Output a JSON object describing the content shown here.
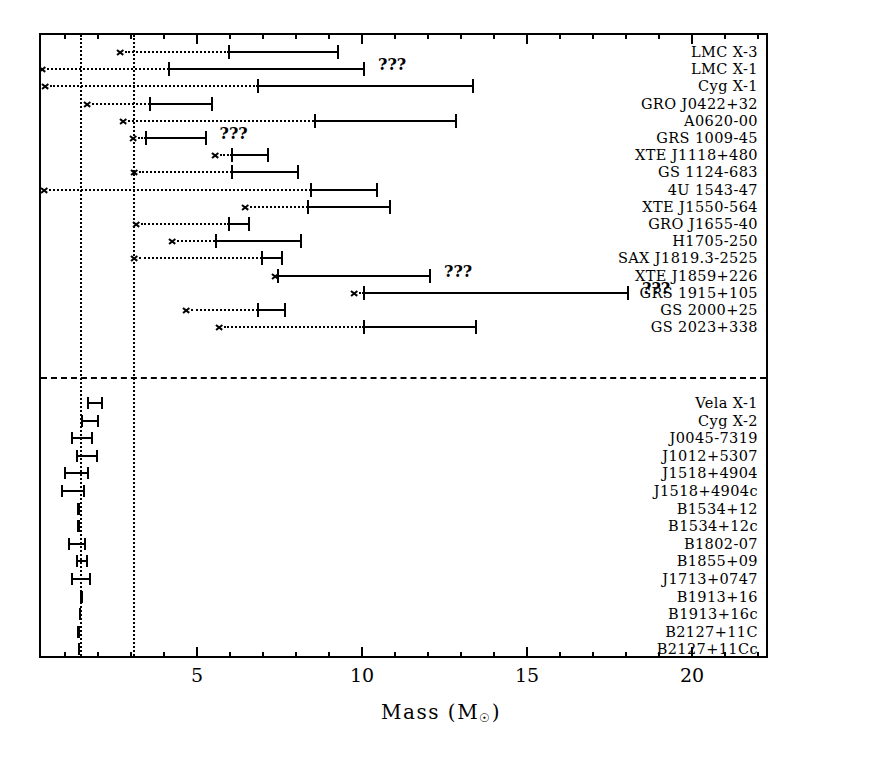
{
  "chart_data": {
    "type": "bar",
    "title": "",
    "xlabel": "Mass (M☉)",
    "ylabel": "",
    "xlim": [
      0,
      23.1
    ],
    "xticks_major": [
      5,
      10,
      15,
      20
    ],
    "xtick_labels": [
      "5",
      "10",
      "15",
      "20"
    ],
    "xticks_minor_step": 1,
    "grid": false,
    "legend": "none",
    "reference_lines": [
      {
        "name": "neutron-star-canonical-mass",
        "x": 1.4,
        "style": "dotted"
      },
      {
        "name": "maximum-neutron-star-mass",
        "x": 3.0,
        "style": "dotted"
      }
    ],
    "group_divider": {
      "style": "dashed",
      "after_row_index": 16
    },
    "groups": [
      {
        "name": "black-hole-candidates",
        "note": "upper panel, rows with dotted lower-limit arrows"
      },
      {
        "name": "neutron-stars",
        "note": "lower panel, compact error bars near 1.0-2.0 solar masses"
      }
    ],
    "rows": [
      {
        "label": "LMC X-3",
        "group": "black-hole-candidates",
        "low": 5.9,
        "high": 9.2,
        "limit_arrow_x": 2.5,
        "uncertain": false
      },
      {
        "label": "LMC X-1",
        "group": "black-hole-candidates",
        "low": 4.1,
        "high": 10.0,
        "limit_arrow_x": 0.15,
        "uncertain": true
      },
      {
        "label": "Cyg X-1",
        "group": "black-hole-candidates",
        "low": 6.8,
        "high": 13.3,
        "limit_arrow_x": 0.25,
        "uncertain": false
      },
      {
        "label": "GRO J0422+32",
        "group": "black-hole-candidates",
        "low": 3.5,
        "high": 5.4,
        "limit_arrow_x": 1.5,
        "uncertain": false
      },
      {
        "label": "A0620-00",
        "group": "black-hole-candidates",
        "low": 8.5,
        "high": 12.8,
        "limit_arrow_x": 2.6,
        "uncertain": false
      },
      {
        "label": "GRS 1009-45",
        "group": "black-hole-candidates",
        "low": 3.4,
        "high": 5.2,
        "limit_arrow_x": 2.9,
        "uncertain": true
      },
      {
        "label": "XTE J1118+480",
        "group": "black-hole-candidates",
        "low": 6.0,
        "high": 7.1,
        "limit_arrow_x": 5.4,
        "uncertain": false
      },
      {
        "label": "GS 1124-683",
        "group": "black-hole-candidates",
        "low": 6.0,
        "high": 8.0,
        "limit_arrow_x": 2.95,
        "uncertain": false
      },
      {
        "label": "4U 1543-47",
        "group": "black-hole-candidates",
        "low": 8.4,
        "high": 10.4,
        "limit_arrow_x": 0.2,
        "uncertain": false
      },
      {
        "label": "XTE J1550-564",
        "group": "black-hole-candidates",
        "low": 8.3,
        "high": 10.8,
        "limit_arrow_x": 6.3,
        "uncertain": false
      },
      {
        "label": "GRO J1655-40",
        "group": "black-hole-candidates",
        "low": 5.9,
        "high": 6.5,
        "limit_arrow_x": 3.0,
        "uncertain": false
      },
      {
        "label": "H1705-250",
        "group": "black-hole-candidates",
        "low": 5.5,
        "high": 8.1,
        "limit_arrow_x": 4.1,
        "uncertain": false
      },
      {
        "label": "SAX J1819.3-2525",
        "group": "black-hole-candidates",
        "low": 6.9,
        "high": 7.5,
        "limit_arrow_x": 2.95,
        "uncertain": false
      },
      {
        "label": "XTE J1859+226",
        "group": "black-hole-candidates",
        "low": 7.4,
        "high": 12.0,
        "limit_arrow_x": 7.2,
        "uncertain": true
      },
      {
        "label": "GRS 1915+105",
        "group": "black-hole-candidates",
        "low": 10.0,
        "high": 18.0,
        "limit_arrow_x": 9.6,
        "uncertain": true
      },
      {
        "label": "GS 2000+25",
        "group": "black-hole-candidates",
        "low": 6.8,
        "high": 7.6,
        "limit_arrow_x": 4.5,
        "uncertain": false
      },
      {
        "label": "GS 2023+338",
        "group": "black-hole-candidates",
        "low": 10.0,
        "high": 13.4,
        "limit_arrow_x": 5.5,
        "uncertain": false
      },
      {
        "label": "Vela X-1",
        "group": "neutron-stars",
        "low": 1.65,
        "high": 2.05,
        "limit_arrow_x": null,
        "uncertain": false
      },
      {
        "label": "Cyg X-2",
        "group": "neutron-stars",
        "low": 1.45,
        "high": 1.95,
        "limit_arrow_x": null,
        "uncertain": false
      },
      {
        "label": "J0045-7319",
        "group": "neutron-stars",
        "low": 1.15,
        "high": 1.75,
        "limit_arrow_x": null,
        "uncertain": false
      },
      {
        "label": "J1012+5307",
        "group": "neutron-stars",
        "low": 1.3,
        "high": 1.9,
        "limit_arrow_x": null,
        "uncertain": false
      },
      {
        "label": "J1518+4904",
        "group": "neutron-stars",
        "low": 0.95,
        "high": 1.65,
        "limit_arrow_x": null,
        "uncertain": false
      },
      {
        "label": "J1518+4904c",
        "group": "neutron-stars",
        "low": 0.85,
        "high": 1.5,
        "limit_arrow_x": null,
        "uncertain": false
      },
      {
        "label": "B1534+12",
        "group": "neutron-stars",
        "low": 1.33,
        "high": 1.36,
        "limit_arrow_x": null,
        "uncertain": false
      },
      {
        "label": "B1534+12c",
        "group": "neutron-stars",
        "low": 1.33,
        "high": 1.36,
        "limit_arrow_x": null,
        "uncertain": false
      },
      {
        "label": "B1802-07",
        "group": "neutron-stars",
        "low": 1.05,
        "high": 1.55,
        "limit_arrow_x": null,
        "uncertain": false
      },
      {
        "label": "B1855+09",
        "group": "neutron-stars",
        "low": 1.3,
        "high": 1.6,
        "limit_arrow_x": null,
        "uncertain": false
      },
      {
        "label": "J1713+0747",
        "group": "neutron-stars",
        "low": 1.15,
        "high": 1.7,
        "limit_arrow_x": null,
        "uncertain": false
      },
      {
        "label": "B1913+16",
        "group": "neutron-stars",
        "low": 1.43,
        "high": 1.45,
        "limit_arrow_x": null,
        "uncertain": false
      },
      {
        "label": "B1913+16c",
        "group": "neutron-stars",
        "low": 1.38,
        "high": 1.4,
        "limit_arrow_x": null,
        "uncertain": false
      },
      {
        "label": "B2127+11C",
        "group": "neutron-stars",
        "low": 1.34,
        "high": 1.37,
        "limit_arrow_x": null,
        "uncertain": false
      },
      {
        "label": "B2127+11Cc",
        "group": "neutron-stars",
        "low": 1.35,
        "high": 1.37,
        "limit_arrow_x": null,
        "uncertain": false
      },
      {
        "label": "B2303+46",
        "group": "neutron-stars",
        "low": 0.85,
        "high": 1.45,
        "limit_arrow_x": null,
        "uncertain": false
      },
      {
        "label": "B2303+46c",
        "group": "neutron-stars",
        "low": 1.1,
        "high": 1.7,
        "limit_arrow_x": null,
        "uncertain": false
      }
    ],
    "uncertain_marker": "???"
  },
  "axis": {
    "x_title_main": "Mass (M",
    "x_title_sun": "☉",
    "x_title_close": ")"
  }
}
